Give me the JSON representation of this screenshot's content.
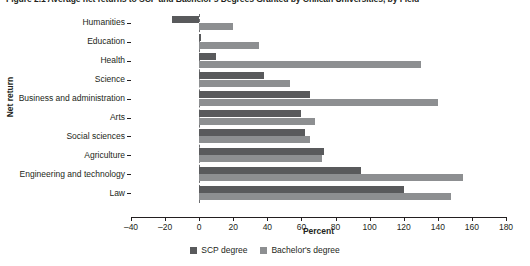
{
  "figure": {
    "title": "Figure 2.1  Average net returns to SCP and Bachelor's Degrees Granted by Chilean Universities, by Field"
  },
  "colors": {
    "scp": "#595a5c",
    "bachelor": "#8d8f91",
    "axis": "#231f20",
    "zero_line": "#6d6e71",
    "background": "#ffffff"
  },
  "legend": {
    "position": "bottom-center",
    "entries": [
      {
        "label": "SCP degree",
        "color": "#595a5c"
      },
      {
        "label": "Bachelor's degree",
        "color": "#8d8f91"
      }
    ]
  },
  "chart_data": {
    "type": "bar",
    "orientation": "horizontal",
    "title": "Figure 2.1  Average net returns to SCP and Bachelor's Degrees Granted by Chilean Universities, by Field",
    "xlabel": "Percent",
    "ylabel": "Net return",
    "xlim": [
      -40,
      180
    ],
    "xticks": [
      -40,
      -20,
      0,
      20,
      40,
      60,
      80,
      100,
      120,
      140,
      160,
      180
    ],
    "xtick_labels": [
      "–40",
      "–20",
      "0",
      "20",
      "40",
      "60",
      "80",
      "100",
      "120",
      "140",
      "160",
      "180"
    ],
    "grid": false,
    "zero_reference_line": true,
    "categories": [
      "Humanities",
      "Education",
      "Health",
      "Science",
      "Business and administration",
      "Arts",
      "Social sciences",
      "Agriculture",
      "Engineering and technology",
      "Law"
    ],
    "series": [
      {
        "name": "SCP degree",
        "color": "#595a5c",
        "values": [
          -16,
          1,
          10,
          38,
          65,
          60,
          62,
          73,
          95,
          120
        ]
      },
      {
        "name": "Bachelor's degree",
        "color": "#8d8f91",
        "values": [
          20,
          35,
          130,
          53,
          140,
          68,
          65,
          72,
          155,
          148
        ]
      }
    ]
  }
}
